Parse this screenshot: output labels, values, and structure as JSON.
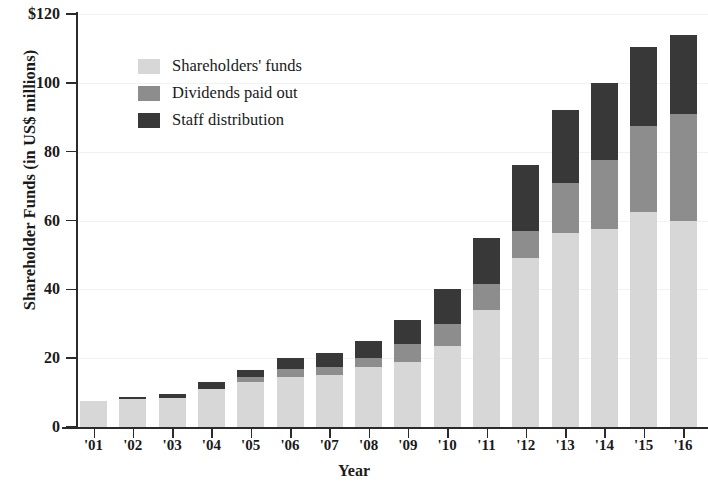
{
  "chart_data": {
    "type": "bar",
    "stacked": true,
    "title": "",
    "xlabel": "Year",
    "ylabel": "Shareholder Funds (in US$ millions)",
    "ylim": [
      0,
      120
    ],
    "ytick_labels": [
      "0",
      "20",
      "40",
      "60",
      "80",
      "100",
      "$120"
    ],
    "ytick_values": [
      0,
      20,
      40,
      60,
      80,
      100,
      120
    ],
    "grid": true,
    "legend_position": "upper-left-inside",
    "categories": [
      "'01",
      "'02",
      "'03",
      "'04",
      "'05",
      "'06",
      "'07",
      "'08",
      "'09",
      "'10",
      "'11",
      "'12",
      "'13",
      "'14",
      "'15",
      "'16"
    ],
    "series": [
      {
        "name": "Shareholders' funds",
        "color": "#d7d7d7",
        "values": [
          7.5,
          8,
          8.5,
          11,
          13,
          14.5,
          15,
          17.5,
          19,
          23.5,
          34,
          49,
          56.5,
          57.5,
          62.5,
          60
        ]
      },
      {
        "name": "Dividends paid out",
        "color": "#8d8d8d",
        "values": [
          0,
          0,
          0,
          0,
          1.5,
          2.5,
          2.5,
          2.5,
          5,
          6.5,
          7.5,
          8,
          14.5,
          20,
          25,
          31
        ]
      },
      {
        "name": "Staff distribution",
        "color": "#383838",
        "values": [
          0,
          0.8,
          1,
          2,
          2,
          3,
          4,
          5,
          7,
          10,
          13.5,
          19,
          21,
          22.5,
          23,
          23
        ]
      }
    ],
    "totals": [
      7.5,
      8.8,
      9.5,
      13,
      16.5,
      20,
      21.5,
      25,
      31,
      40,
      55,
      76,
      92,
      100,
      110.5,
      114
    ]
  },
  "legend": {
    "items": [
      {
        "label": "Shareholders' funds",
        "color": "#d7d7d7"
      },
      {
        "label": "Dividends paid out",
        "color": "#8d8d8d"
      },
      {
        "label": "Staff distribution",
        "color": "#383838"
      }
    ]
  }
}
